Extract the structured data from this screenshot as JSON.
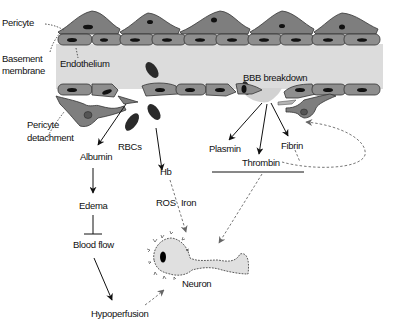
{
  "diagram": {
    "labels": {
      "pericyte": "Pericyte",
      "basement_line1": "Basement",
      "basement_line2": "membrane",
      "endothelium": "Endothelium",
      "bbb_breakdown": "BBB breakdown",
      "pericyte_detach_line1": "Pericyte",
      "pericyte_detach_line2": "detachment",
      "albumin": "Albumin",
      "rbcs": "RBCs",
      "hb": "Hb",
      "plasmin": "Plasmin",
      "thrombin": "Thrombin",
      "fibrin": "Fibrin",
      "edema": "Edema",
      "ros": "ROS",
      "iron": "Iron",
      "blood_flow": "Blood flow",
      "hypoperfusion": "Hypoperfusion",
      "neuron": "Neuron"
    },
    "colors": {
      "vessel_lumen": "#dcdcdc",
      "cell_fill": "#8e8e8e",
      "pericyte_fill": "#7e7e7e",
      "nucleus": "#111111",
      "rbc": "#2a2a2a",
      "neuron_fill": "#e0e0e0",
      "arrow": "#111111",
      "dashed_arrow": "#777777"
    },
    "edges": [
      {
        "from": "BBB breakdown",
        "to": "Albumin",
        "style": "solid"
      },
      {
        "from": "BBB breakdown",
        "to": "Hb",
        "style": "solid"
      },
      {
        "from": "BBB breakdown",
        "to": "Plasmin",
        "style": "solid"
      },
      {
        "from": "BBB breakdown",
        "to": "Thrombin",
        "style": "solid"
      },
      {
        "from": "BBB breakdown",
        "to": "Fibrin",
        "style": "solid"
      },
      {
        "from": "Albumin",
        "to": "Edema",
        "style": "solid"
      },
      {
        "from": "Edema",
        "to": "Blood flow",
        "style": "inhibit"
      },
      {
        "from": "Blood flow",
        "to": "Hypoperfusion",
        "style": "solid"
      },
      {
        "from": "Hypoperfusion",
        "to": "Neuron",
        "style": "dashed"
      },
      {
        "from": "Hb",
        "to": "Neuron",
        "style": "dashed",
        "via": [
          "ROS",
          "Iron"
        ]
      },
      {
        "from": "Plasmin/Thrombin/Fibrin",
        "to": "Neuron",
        "style": "dashed"
      },
      {
        "from": "Thrombin/Fibrin",
        "to": "Pericyte",
        "style": "dashed"
      }
    ]
  }
}
